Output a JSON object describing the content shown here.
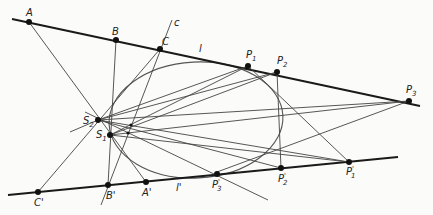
{
  "diagram": {
    "lines": {
      "l": "l",
      "l_prime": "l'",
      "c": "c"
    },
    "points": {
      "A": "A",
      "B": "B",
      "C": "C",
      "A_prime": "A'",
      "B_prime": "B'",
      "C_prime": "C'",
      "P1": "P",
      "P2": "P",
      "P3": "P",
      "P1_prime": "P",
      "P2_prime": "P",
      "P3_prime": "P",
      "S1": "S",
      "S2": "S"
    },
    "subscripts": {
      "P1": "1",
      "P2": "2",
      "P3": "3",
      "P1_prime": "1",
      "P2_prime": "2",
      "P3_prime": "3",
      "S1": "1",
      "S2": "2"
    },
    "primes": {
      "P1_prime": "'",
      "P2_prime": "'",
      "P3_prime": "'"
    }
  }
}
